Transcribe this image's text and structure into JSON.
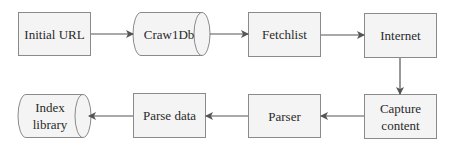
{
  "diagram": {
    "type": "flowchart",
    "nodes": [
      {
        "id": "initial_url",
        "label": "Initial URL",
        "shape": "rectangle"
      },
      {
        "id": "crawldb",
        "label": "Craw1Db",
        "shape": "cylinder"
      },
      {
        "id": "fetchlist",
        "label": "Fetchlist",
        "shape": "rectangle"
      },
      {
        "id": "internet",
        "label": "Internet",
        "shape": "rectangle"
      },
      {
        "id": "capture_content",
        "label": "Capture content",
        "shape": "rectangle"
      },
      {
        "id": "parser",
        "label": "Parser",
        "shape": "rectangle"
      },
      {
        "id": "parse_data",
        "label": "Parse data",
        "shape": "rectangle"
      },
      {
        "id": "index_library",
        "label": "Index library",
        "shape": "cylinder"
      }
    ],
    "edges": [
      {
        "from": "initial_url",
        "to": "crawldb"
      },
      {
        "from": "crawldb",
        "to": "fetchlist"
      },
      {
        "from": "fetchlist",
        "to": "internet"
      },
      {
        "from": "internet",
        "to": "capture_content"
      },
      {
        "from": "capture_content",
        "to": "parser"
      },
      {
        "from": "parser",
        "to": "parse_data"
      },
      {
        "from": "parse_data",
        "to": "index_library"
      }
    ],
    "colors": {
      "box_fill": "#f4f4f4",
      "box_stroke": "#8a8a8a",
      "arrow": "#555555"
    }
  }
}
